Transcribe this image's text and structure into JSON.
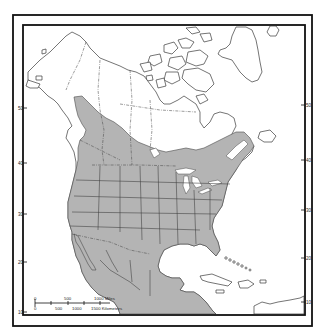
{
  "map": {
    "subject": "North America species range map",
    "colors": {
      "range_fill": "#b4b4b4",
      "land_fill": "#ffffff",
      "outline": "#3a3a3a",
      "frame": "#111111"
    },
    "latitude_labels_left": [
      {
        "label": "50",
        "y": 108
      },
      {
        "label": "40",
        "y": 163
      },
      {
        "label": "30",
        "y": 214
      },
      {
        "label": "20",
        "y": 262
      },
      {
        "label": "10",
        "y": 312
      }
    ],
    "latitude_labels_right": [
      {
        "label": "50",
        "y": 105
      },
      {
        "label": "40",
        "y": 160
      },
      {
        "label": "30",
        "y": 210
      },
      {
        "label": "20",
        "y": 258
      },
      {
        "label": "10",
        "y": 302
      }
    ],
    "scale_bar": {
      "miles_ticks": [
        "0",
        "500",
        "1000 Miles"
      ],
      "km_ticks": [
        "0",
        "500",
        "1000",
        "1500 Kilometers"
      ]
    }
  }
}
